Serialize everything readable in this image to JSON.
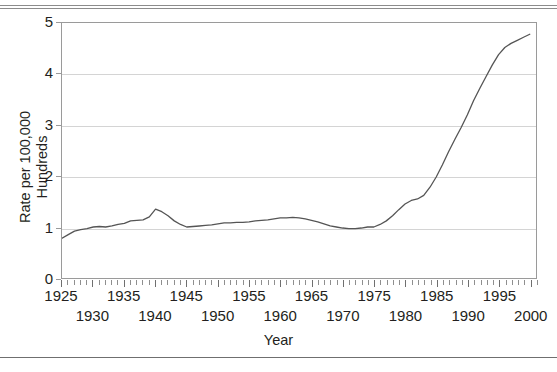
{
  "chart_data": {
    "type": "line",
    "title": "",
    "xlabel": "Year",
    "ylabel": "Rate per 100,000\nHundreds",
    "xlim": [
      1925,
      2001
    ],
    "ylim": [
      0,
      5
    ],
    "yticks": [
      0,
      1,
      2,
      3,
      4,
      5
    ],
    "ytick_labels": [
      "0",
      "1",
      "2",
      "3",
      "4",
      "5"
    ],
    "xticks_row1": [
      1925,
      1935,
      1945,
      1955,
      1965,
      1975,
      1985,
      1995
    ],
    "xticks_row2": [
      1930,
      1940,
      1950,
      1960,
      1970,
      1980,
      1990,
      2000
    ],
    "xtick_labels_row1": [
      "1925",
      "1935",
      "1945",
      "1955",
      "1965",
      "1975",
      "1985",
      "1995"
    ],
    "xtick_labels_row2": [
      "1930",
      "1940",
      "1950",
      "1960",
      "1970",
      "1980",
      "1990",
      "2000"
    ],
    "minor_tick_interval": 1,
    "grid": "horizontal",
    "legend": "none",
    "line_color": "#555555",
    "grid_color": "#d4d4d4",
    "frame_color": "#9a9a9a",
    "x": [
      1925,
      1926,
      1927,
      1928,
      1929,
      1930,
      1931,
      1932,
      1933,
      1934,
      1935,
      1936,
      1937,
      1938,
      1939,
      1940,
      1941,
      1942,
      1943,
      1944,
      1945,
      1946,
      1947,
      1948,
      1949,
      1950,
      1951,
      1952,
      1953,
      1954,
      1955,
      1956,
      1957,
      1958,
      1959,
      1960,
      1961,
      1962,
      1963,
      1964,
      1965,
      1966,
      1967,
      1968,
      1969,
      1970,
      1971,
      1972,
      1973,
      1974,
      1975,
      1976,
      1977,
      1978,
      1979,
      1980,
      1981,
      1982,
      1983,
      1984,
      1985,
      1986,
      1987,
      1988,
      1989,
      1990,
      1991,
      1992,
      1993,
      1994,
      1995,
      1996,
      1997,
      1998,
      1999,
      2000
    ],
    "y": [
      0.78,
      0.85,
      0.92,
      0.95,
      0.97,
      1.0,
      1.01,
      1.0,
      1.02,
      1.05,
      1.07,
      1.12,
      1.13,
      1.14,
      1.2,
      1.35,
      1.3,
      1.22,
      1.12,
      1.05,
      1.0,
      1.01,
      1.02,
      1.03,
      1.04,
      1.06,
      1.08,
      1.08,
      1.09,
      1.09,
      1.1,
      1.12,
      1.13,
      1.14,
      1.16,
      1.18,
      1.18,
      1.19,
      1.18,
      1.16,
      1.13,
      1.1,
      1.06,
      1.02,
      1.0,
      0.98,
      0.97,
      0.97,
      0.98,
      1.0,
      1.0,
      1.05,
      1.12,
      1.22,
      1.34,
      1.45,
      1.52,
      1.55,
      1.62,
      1.78,
      1.98,
      2.22,
      2.48,
      2.72,
      2.95,
      3.2,
      3.48,
      3.72,
      3.95,
      4.18,
      4.38,
      4.52,
      4.6,
      4.66,
      4.72,
      4.78
    ]
  },
  "axes": {
    "y_title": "Rate per 100,000\nHundreds",
    "x_title": "Year"
  }
}
